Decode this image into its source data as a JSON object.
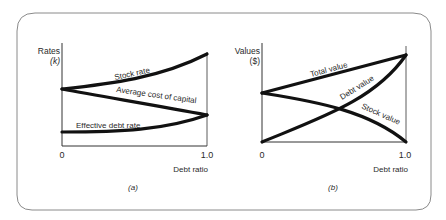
{
  "colors": {
    "curve": "#111111",
    "axis": "#333333",
    "frame": "#8a8a8a",
    "text": "#2a2a2a",
    "background": "#ffffff"
  },
  "panels": [
    {
      "id": "a",
      "caption": "(a)",
      "y_axis_label_line1": "Rates",
      "y_axis_label_line2": "(k)",
      "x_axis_label": "Debt ratio",
      "x_tick_min": "0",
      "x_tick_max": "1.0",
      "curves": [
        {
          "name": "Stock rate",
          "label": "Stock rate"
        },
        {
          "name": "Average cost of capital",
          "label": "Average cost of capital"
        },
        {
          "name": "Effective debt rate",
          "label": "Effective debt rate"
        }
      ]
    },
    {
      "id": "b",
      "caption": "(b)",
      "y_axis_label_line1": "Values",
      "y_axis_label_line2": "($)",
      "x_axis_label": "Debt ratio",
      "x_tick_min": "0",
      "x_tick_max": "1.0",
      "curves": [
        {
          "name": "Total value",
          "label": "Total value"
        },
        {
          "name": "Debt value",
          "label": "Debt value"
        },
        {
          "name": "Stock value",
          "label": "Stock value"
        }
      ]
    }
  ]
}
